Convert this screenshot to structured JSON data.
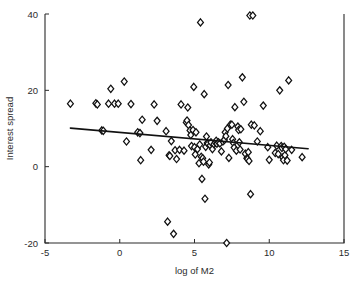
{
  "figure": {
    "background_color": "#ffffff",
    "foreground_color": "#1a1a1a"
  },
  "chart_data": {
    "type": "scatter",
    "title": "",
    "xlabel": "log of M2",
    "ylabel": "Interest spread",
    "xlim": [
      -5,
      15
    ],
    "ylim": [
      -20,
      40
    ],
    "xticks": [
      -5,
      0,
      5,
      10,
      15
    ],
    "xtick_labels": [
      "-5",
      "0",
      "5",
      "10",
      "15"
    ],
    "yticks": [
      -20,
      0,
      20,
      40
    ],
    "ytick_labels": [
      "-20",
      "0",
      "20",
      "40"
    ],
    "grid": false,
    "legend": null,
    "marker": "diamond-open",
    "marker_color": "#111111",
    "marker_fill": "#ffffff",
    "series": [
      {
        "name": "Interest spread vs log of M2",
        "points": [
          [
            -3.3,
            16.5
          ],
          [
            -1.6,
            16.6
          ],
          [
            -1.5,
            16.3
          ],
          [
            -1.2,
            9.5
          ],
          [
            -1.1,
            9.4
          ],
          [
            -0.75,
            16.5
          ],
          [
            -0.6,
            20.4
          ],
          [
            -0.35,
            16.5
          ],
          [
            -0.1,
            16.5
          ],
          [
            0.3,
            22.3
          ],
          [
            0.45,
            6.6
          ],
          [
            0.75,
            16.4
          ],
          [
            1.2,
            9.0
          ],
          [
            1.35,
            8.8
          ],
          [
            1.4,
            1.7
          ],
          [
            1.5,
            12.3
          ],
          [
            2.1,
            4.4
          ],
          [
            2.3,
            16.3
          ],
          [
            2.5,
            12.0
          ],
          [
            3.1,
            9.3
          ],
          [
            3.2,
            -14.4
          ],
          [
            3.3,
            3.0
          ],
          [
            3.35,
            2.8
          ],
          [
            3.45,
            6.7
          ],
          [
            3.6,
            -17.6
          ],
          [
            3.7,
            4.3
          ],
          [
            3.8,
            2.0
          ],
          [
            4.0,
            4.4
          ],
          [
            4.1,
            16.3
          ],
          [
            4.3,
            4.2
          ],
          [
            4.45,
            11.6
          ],
          [
            4.5,
            12.1
          ],
          [
            4.55,
            15.5
          ],
          [
            4.6,
            10.9
          ],
          [
            4.7,
            9.5
          ],
          [
            4.75,
            8.3
          ],
          [
            4.8,
            5.4
          ],
          [
            4.9,
            9.6
          ],
          [
            4.95,
            20.9
          ],
          [
            5.0,
            5.1
          ],
          [
            5.05,
            3.2
          ],
          [
            5.1,
            9.0
          ],
          [
            5.2,
            4.6
          ],
          [
            5.3,
            0.9
          ],
          [
            5.35,
            5.8
          ],
          [
            5.4,
            37.8
          ],
          [
            5.45,
            2.6
          ],
          [
            5.5,
            -3.2
          ],
          [
            5.55,
            2.2
          ],
          [
            5.6,
            1.3
          ],
          [
            5.65,
            19.0
          ],
          [
            5.7,
            -8.4
          ],
          [
            5.75,
            5.2
          ],
          [
            5.8,
            7.9
          ],
          [
            5.85,
            6.2
          ],
          [
            5.9,
            6.0
          ],
          [
            5.95,
            0.6
          ],
          [
            6.0,
            1.1
          ],
          [
            6.05,
            5.6
          ],
          [
            6.1,
            6.4
          ],
          [
            6.2,
            4.6
          ],
          [
            6.3,
            5.9
          ],
          [
            6.4,
            6.3
          ],
          [
            6.45,
            6.8
          ],
          [
            6.5,
            6.0
          ],
          [
            6.6,
            6.4
          ],
          [
            6.7,
            6.1
          ],
          [
            6.8,
            4.0
          ],
          [
            6.9,
            6.6
          ],
          [
            7.0,
            7.0
          ],
          [
            7.05,
            9.0
          ],
          [
            7.1,
            8.0
          ],
          [
            7.15,
            -20.0
          ],
          [
            7.2,
            10.0
          ],
          [
            7.25,
            21.4
          ],
          [
            7.3,
            2.3
          ],
          [
            7.4,
            11.0
          ],
          [
            7.5,
            11.0
          ],
          [
            7.55,
            7.2
          ],
          [
            7.6,
            6.2
          ],
          [
            7.65,
            5.0
          ],
          [
            7.7,
            15.6
          ],
          [
            7.8,
            4.2
          ],
          [
            7.9,
            10.5
          ],
          [
            7.95,
            9.6
          ],
          [
            8.0,
            6.4
          ],
          [
            8.05,
            4.5
          ],
          [
            8.1,
            9.8
          ],
          [
            8.2,
            23.4
          ],
          [
            8.3,
            17.0
          ],
          [
            8.4,
            3.4
          ],
          [
            8.5,
            2.2
          ],
          [
            8.55,
            2.0
          ],
          [
            8.6,
            3.8
          ],
          [
            8.65,
            1.5
          ],
          [
            8.7,
            39.6
          ],
          [
            8.75,
            -7.2
          ],
          [
            8.8,
            11.0
          ],
          [
            8.9,
            39.6
          ],
          [
            9.0,
            10.8
          ],
          [
            9.2,
            6.6
          ],
          [
            9.4,
            9.3
          ],
          [
            9.6,
            16.0
          ],
          [
            9.9,
            5.1
          ],
          [
            10.0,
            1.8
          ],
          [
            10.4,
            3.6
          ],
          [
            10.5,
            5.5
          ],
          [
            10.6,
            3.3
          ],
          [
            10.7,
            20.0
          ],
          [
            10.8,
            5.4
          ],
          [
            10.85,
            4.9
          ],
          [
            10.9,
            2.4
          ],
          [
            10.95,
            1.7
          ],
          [
            11.0,
            5.2
          ],
          [
            11.05,
            3.0
          ],
          [
            11.1,
            4.6
          ],
          [
            11.2,
            1.6
          ],
          [
            11.3,
            22.6
          ],
          [
            11.5,
            4.4
          ],
          [
            12.2,
            2.5
          ]
        ]
      }
    ],
    "fit_line": {
      "name": "regression line",
      "x_start": -3.3,
      "y_start": 10.1,
      "x_end": 12.6,
      "y_end": 4.7,
      "color": "#111111"
    }
  }
}
